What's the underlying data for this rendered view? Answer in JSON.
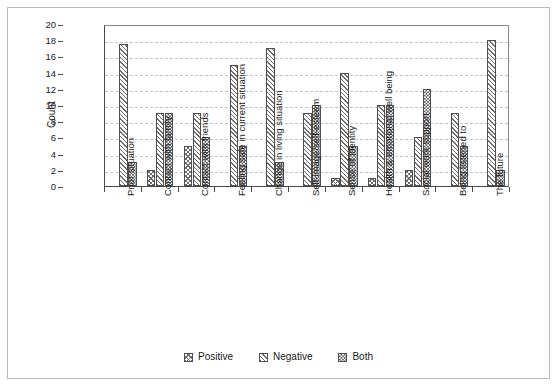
{
  "chart_data": {
    "type": "bar",
    "title": "",
    "subtitle": "",
    "xlabel": "",
    "ylabel": "Count",
    "ylim": [
      0,
      20
    ],
    "ytick_step": 2,
    "yticks": [
      20,
      18,
      16,
      14,
      12,
      10,
      8,
      6,
      4,
      2,
      0
    ],
    "grid": "horizontal-dashed",
    "legend_position": "bottom-center",
    "grouped": true,
    "categories": [
      "Prior situation",
      "Contact with family",
      "Contact with friends",
      "Feeling safe in current situation",
      "Change in living situation",
      "Self-image/self-esteem",
      "Sense of identity",
      "Health & emotional well being",
      "Social work support",
      "Being listened to",
      "The future"
    ],
    "series": [
      {
        "name": "Positive",
        "pattern": "cross-hatch",
        "values": [
          0,
          2,
          5,
          0,
          0,
          0,
          1,
          1,
          2,
          0,
          0
        ]
      },
      {
        "name": "Negative",
        "pattern": "diagonal-hatch",
        "values": [
          17.5,
          9,
          9,
          15,
          17,
          9,
          14,
          10,
          6,
          9,
          18
        ]
      },
      {
        "name": "Both",
        "pattern": "checkerboard",
        "values": [
          3,
          9,
          6,
          5,
          3,
          10,
          5,
          10,
          12,
          5,
          2
        ]
      }
    ]
  },
  "legend": {
    "items": [
      {
        "label": "Positive",
        "pattern": "cross-hatch"
      },
      {
        "label": "Negative",
        "pattern": "diagonal-hatch"
      },
      {
        "label": "Both",
        "pattern": "checkerboard"
      }
    ]
  },
  "colors": {
    "figure_border": "#b9b9b9",
    "axis": "#4a4a4a",
    "gridline": "#c6c6d2",
    "bar_outline": "#4f4f4f",
    "hatch": "#6e6e6e",
    "text": "#1a1a1a",
    "background": "#ffffff"
  }
}
